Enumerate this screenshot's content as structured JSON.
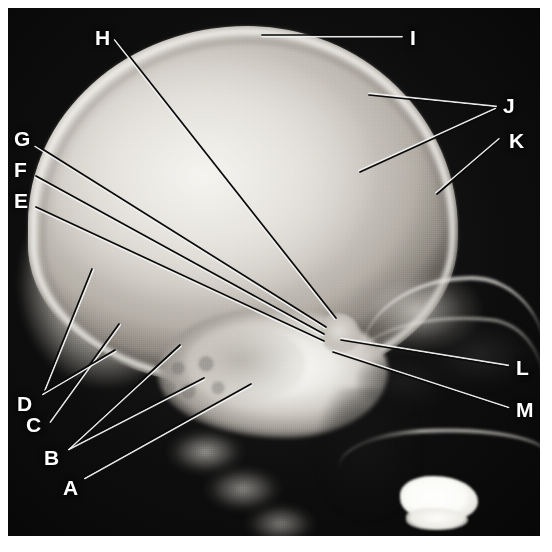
{
  "image": {
    "kind": "radiograph",
    "view": "lateral skull X-ray",
    "width": 552,
    "height": 552,
    "border_color": "#ffffff",
    "film_color": "#0d0d0d",
    "label_color": "#ffffff",
    "leader_dark_color": "#0a0a0a",
    "leader_light_color": "#f2f2f2"
  },
  "labels": [
    {
      "id": "A",
      "text": "A",
      "x": 63,
      "y": 477
    },
    {
      "id": "B",
      "text": "B",
      "x": 44,
      "y": 447
    },
    {
      "id": "C",
      "text": "C",
      "x": 26,
      "y": 414
    },
    {
      "id": "D",
      "text": "D",
      "x": 17,
      "y": 393
    },
    {
      "id": "E",
      "text": "E",
      "x": 14,
      "y": 190
    },
    {
      "id": "F",
      "text": "F",
      "x": 14,
      "y": 159
    },
    {
      "id": "G",
      "text": "G",
      "x": 14,
      "y": 128
    },
    {
      "id": "H",
      "text": "H",
      "x": 95,
      "y": 27
    },
    {
      "id": "I",
      "text": "I",
      "x": 410,
      "y": 27
    },
    {
      "id": "J",
      "text": "J",
      "x": 503,
      "y": 95
    },
    {
      "id": "K",
      "text": "K",
      "x": 509,
      "y": 130
    },
    {
      "id": "L",
      "text": "L",
      "x": 516,
      "y": 357
    },
    {
      "id": "M",
      "text": "M",
      "x": 516,
      "y": 399
    }
  ],
  "leaders": [
    {
      "for": "A",
      "x1": 84,
      "y1": 477,
      "x2": 251,
      "y2": 384
    },
    {
      "for": "B",
      "x1": 68,
      "y1": 448,
      "x2": 204,
      "y2": 378
    },
    {
      "for": "B",
      "x1": 68,
      "y1": 448,
      "x2": 180,
      "y2": 345
    },
    {
      "for": "C",
      "x1": 49,
      "y1": 421,
      "x2": 119,
      "y2": 324
    },
    {
      "for": "D",
      "x1": 42,
      "y1": 393,
      "x2": 92,
      "y2": 269
    },
    {
      "for": "D",
      "x1": 42,
      "y1": 393,
      "x2": 115,
      "y2": 350
    },
    {
      "for": "E",
      "x1": 36,
      "y1": 207,
      "x2": 324,
      "y2": 341
    },
    {
      "for": "F",
      "x1": 36,
      "y1": 176,
      "x2": 324,
      "y2": 334
    },
    {
      "for": "G",
      "x1": 36,
      "y1": 145,
      "x2": 326,
      "y2": 327
    },
    {
      "for": "H",
      "x1": 116,
      "y1": 39,
      "x2": 336,
      "y2": 318
    },
    {
      "for": "I",
      "x1": 262,
      "y1": 35,
      "x2": 402,
      "y2": 35
    },
    {
      "for": "J",
      "x1": 496,
      "y1": 108,
      "x2": 369,
      "y2": 95
    },
    {
      "for": "J",
      "x1": 496,
      "y1": 110,
      "x2": 360,
      "y2": 172
    },
    {
      "for": "K",
      "x1": 500,
      "y1": 140,
      "x2": 437,
      "y2": 194
    },
    {
      "for": "L",
      "x1": 508,
      "y1": 367,
      "x2": 341,
      "y2": 340
    },
    {
      "for": "M",
      "x1": 508,
      "y1": 409,
      "x2": 333,
      "y2": 352
    }
  ]
}
